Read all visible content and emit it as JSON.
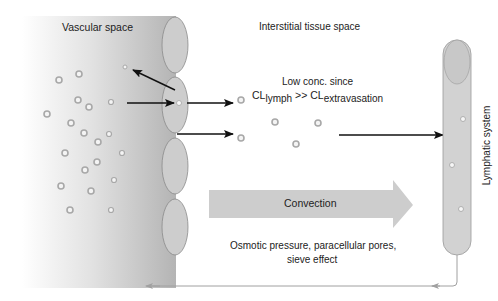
{
  "labels": {
    "vascular_space": "Vascular space",
    "interstitial_space": "Interstitial tissue space",
    "low_conc_line1": "Low conc. since",
    "cl_symbol": "CL",
    "lymph_sub": "lymph",
    "gtgt": " >> ",
    "extravasation_sub": "extravasation",
    "lymphatic_system": "Lymphatic system",
    "convection": "Convection",
    "osmotic_line1": "Osmotic pressure, paracellular pores,",
    "osmotic_line2": "sieve effect"
  },
  "colors": {
    "vessel_gradient_start": "#ffffff",
    "vessel_gradient_end": "#b8b8b8",
    "endothelial_cell": "#cfcfcf",
    "cell_outline": "#8a8a8a",
    "lymph_vessel": "#d2d2d2",
    "convection_arrow": "#cdcdcd",
    "arrow": "#111111",
    "return_line": "#a0a0a0",
    "particle_ring": "#a8a8a8"
  }
}
